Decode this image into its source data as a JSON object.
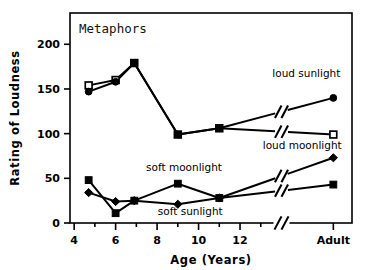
{
  "chart_data": {
    "type": "line",
    "title": "Metaphors",
    "xlabel": "Age (Years)",
    "ylabel": "Rating of Loudness",
    "x": [
      4.7,
      6.0,
      6.9,
      9.0,
      11.0,
      16.5
    ],
    "x_display": [
      "4.7",
      "6",
      "6.9",
      "9",
      "11",
      "Adult"
    ],
    "xticks": [
      4,
      6,
      8,
      10,
      12
    ],
    "xtick_labels": [
      "4",
      "6",
      "8",
      "10",
      "12"
    ],
    "x_extra_tick_label": "Adult",
    "yticks": [
      0,
      50,
      100,
      150,
      200
    ],
    "ytick_labels": [
      "0",
      "50",
      "100",
      "150",
      "200"
    ],
    "xlim": [
      3.8,
      17.4
    ],
    "ylim": [
      0,
      235
    ],
    "grid": false,
    "axis_break": true,
    "axis_break_x": [
      13.6,
      14.4
    ],
    "legend": "inline-annotations",
    "series": [
      {
        "name": "loud moonlight",
        "label": "loud moonlight",
        "marker": "open-square",
        "values": [
          154,
          160,
          179,
          99,
          106,
          99
        ],
        "label_x": 15.0,
        "label_y": 83,
        "label_anchor": "middle"
      },
      {
        "name": "loud sunlight",
        "label": "loud sunlight",
        "marker": "filled-circle",
        "values": [
          147,
          158,
          179,
          99,
          106,
          140
        ],
        "label_x": 15.2,
        "label_y": 163,
        "label_anchor": "middle"
      },
      {
        "name": "soft moonlight",
        "label": "soft moonlight",
        "marker": "filled-square",
        "values": [
          48,
          11,
          25,
          44,
          28,
          43
        ],
        "label_x": 9.3,
        "label_y": 58,
        "label_anchor": "middle"
      },
      {
        "name": "soft sunlight",
        "label": "soft sunlight",
        "marker": "filled-diamond",
        "values": [
          34,
          24,
          25,
          21,
          28,
          73
        ],
        "label_x": 9.6,
        "label_y": 9,
        "label_anchor": "middle"
      }
    ],
    "colors": {
      "line": "#000000",
      "marker_fill": "#000000",
      "marker_open_fill": "#ffffff",
      "background": "#ffffff",
      "frame": "#000000"
    }
  }
}
